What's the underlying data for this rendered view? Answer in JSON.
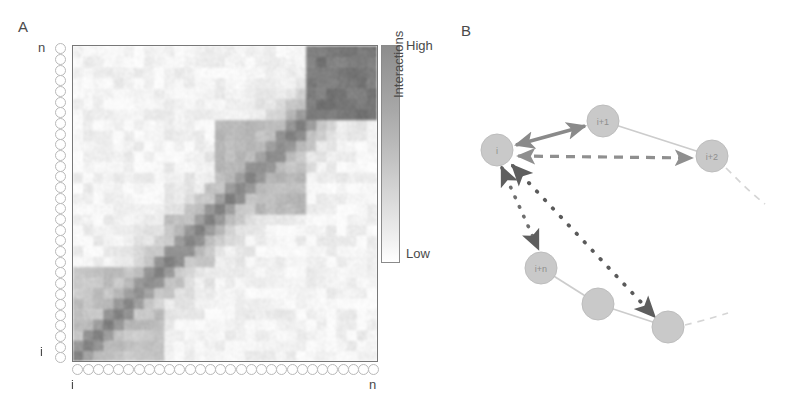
{
  "figure": {
    "panels": [
      {
        "id": "A",
        "label": "A"
      },
      {
        "id": "B",
        "label": "B"
      }
    ]
  },
  "panelA": {
    "label": "A",
    "type": "interaction-contact-map",
    "axes": {
      "y_top_label": "n",
      "y_bottom_label": "i",
      "x_left_label": "i",
      "x_right_label": "n",
      "residue_count": 30
    },
    "colorbar": {
      "title": "Interactions",
      "high_label": "High",
      "low_label": "Low",
      "high_color": "#8d8d8d",
      "low_color": "#ffffff"
    }
  },
  "panelB": {
    "label": "B",
    "node_fill": "#c9c9c9",
    "node_stroke": "#b3b3b3",
    "nodes": [
      {
        "id": "i",
        "label": "i",
        "cx": 57,
        "cy": 150,
        "r": 16
      },
      {
        "id": "i+1",
        "label": "i+1",
        "cx": 163,
        "cy": 121,
        "r": 16
      },
      {
        "id": "i+2",
        "label": "i+2",
        "cx": 272,
        "cy": 156,
        "r": 16
      },
      {
        "id": "i+n",
        "label": "i+n",
        "cx": 101,
        "cy": 268,
        "r": 16
      },
      {
        "id": "u1",
        "label": "",
        "cx": 158,
        "cy": 304,
        "r": 16
      },
      {
        "id": "u2",
        "label": "",
        "cx": 228,
        "cy": 327,
        "r": 16
      }
    ],
    "edges": [
      {
        "from": "i",
        "to": "i+1",
        "style": "solid",
        "arrows": "both",
        "color": "#8a8a8a"
      },
      {
        "from": "i",
        "to": "i+2",
        "style": "dashed",
        "arrows": "both",
        "color": "#8a8a8a"
      },
      {
        "from": "i",
        "to": "i+n",
        "style": "dotted",
        "arrows": "both",
        "color": "#6e6e6e"
      },
      {
        "from": "i",
        "to": "u2",
        "style": "dotted",
        "arrows": "both",
        "color": "#5a5a5a"
      },
      {
        "from": "i+1",
        "to": "i+2",
        "style": "backbone",
        "arrows": "none",
        "color": "#c3c3c3"
      },
      {
        "from": "i+n",
        "to": "u1",
        "style": "backbone",
        "arrows": "none",
        "color": "#c3c3c3"
      },
      {
        "from": "u1",
        "to": "u2",
        "style": "backbone",
        "arrows": "none",
        "color": "#c3c3c3"
      }
    ],
    "trailing_chains": [
      {
        "from": "i+2",
        "style": "dashed-tail",
        "color": "#d2d2d2"
      },
      {
        "from": "u2",
        "style": "dashed-tail",
        "color": "#d2d2d2"
      }
    ]
  },
  "chart_data": {
    "type": "heatmap",
    "title": "",
    "xlabel": "",
    "ylabel": "",
    "x_tick_labels": [
      "i",
      "n"
    ],
    "y_tick_labels": [
      "i",
      "n"
    ],
    "colorbar_label": "Interactions",
    "colorbar_ticks": [
      "Low",
      "High"
    ],
    "grid": false,
    "legend": "none",
    "n_bins": 30,
    "value_range": [
      0,
      1
    ],
    "diagonal_blocks": [
      {
        "start": 0,
        "end": 5,
        "intensity": 0.78
      },
      {
        "start": 5,
        "end": 9,
        "intensity": 0.62
      },
      {
        "start": 9,
        "end": 14,
        "intensity": 0.7
      },
      {
        "start": 14,
        "end": 18,
        "intensity": 0.58
      },
      {
        "start": 18,
        "end": 23,
        "intensity": 0.72
      },
      {
        "start": 23,
        "end": 30,
        "intensity": 0.85
      }
    ],
    "offdiagonal_features": [
      {
        "x_start": 23,
        "x_end": 30,
        "y_start": 23,
        "y_end": 30,
        "intensity": 0.88
      },
      {
        "x_start": 18,
        "x_end": 23,
        "y_start": 14,
        "y_end": 18,
        "intensity": 0.45
      },
      {
        "x_start": 0,
        "x_end": 5,
        "y_start": 5,
        "y_end": 9,
        "intensity": 0.4
      }
    ],
    "background_intensity": 0.08
  }
}
